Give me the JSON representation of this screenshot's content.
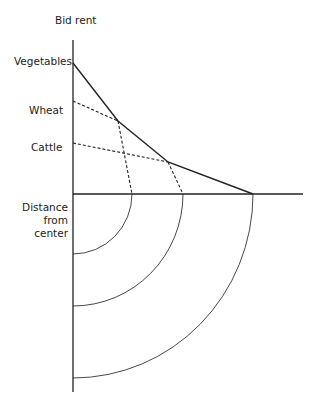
{
  "diagram": {
    "type": "bid-rent-curve",
    "y_axis_label": "Bid rent",
    "x_axis_label_lines": [
      "Distance",
      "from",
      "center"
    ],
    "curves": [
      {
        "name": "Vegetables",
        "y_intercept_px": 63,
        "x_intercept_px": 132
      },
      {
        "name": "Wheat",
        "y_intercept_px": 101,
        "x_intercept_px": 183
      },
      {
        "name": "Cattle",
        "y_intercept_px": 143,
        "x_intercept_px": 253
      }
    ],
    "rings": [
      "Vegetables zone",
      "Wheat zone",
      "Cattle zone"
    ]
  }
}
